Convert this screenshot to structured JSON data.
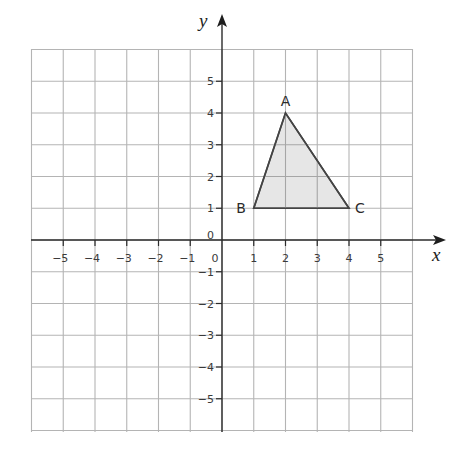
{
  "diagram": {
    "type": "coordinate-grid",
    "x_axis": {
      "label": "x",
      "ticks": [
        -5,
        -4,
        -3,
        -2,
        -1,
        0,
        1,
        2,
        3,
        4,
        5
      ],
      "range": [
        -6,
        6
      ]
    },
    "y_axis": {
      "label": "y",
      "ticks": [
        -5,
        -4,
        -3,
        -2,
        -1,
        0,
        1,
        2,
        3,
        4,
        5
      ],
      "range": [
        -6,
        6
      ]
    },
    "x_tick_labels": [
      "−5",
      "−4",
      "−3",
      "−2",
      "−1",
      "0",
      "1",
      "2",
      "3",
      "4",
      "5"
    ],
    "y_tick_labels": [
      "5",
      "4",
      "3",
      "2",
      "1",
      "0",
      "−1",
      "−2",
      "−3",
      "−4",
      "−5"
    ],
    "shape": {
      "name": "triangle ABC",
      "vertices": [
        {
          "label": "A",
          "x": 2,
          "y": 4
        },
        {
          "label": "B",
          "x": 1,
          "y": 1
        },
        {
          "label": "C",
          "x": 4,
          "y": 1
        }
      ],
      "fill": "#e6e6e6",
      "stroke": "#444444"
    }
  },
  "layout": {
    "origin_px": [
      222,
      240
    ],
    "unit_px": 31.75,
    "grid_left": 31,
    "grid_top": 49,
    "grid_right": 412,
    "grid_bottom": 432
  }
}
